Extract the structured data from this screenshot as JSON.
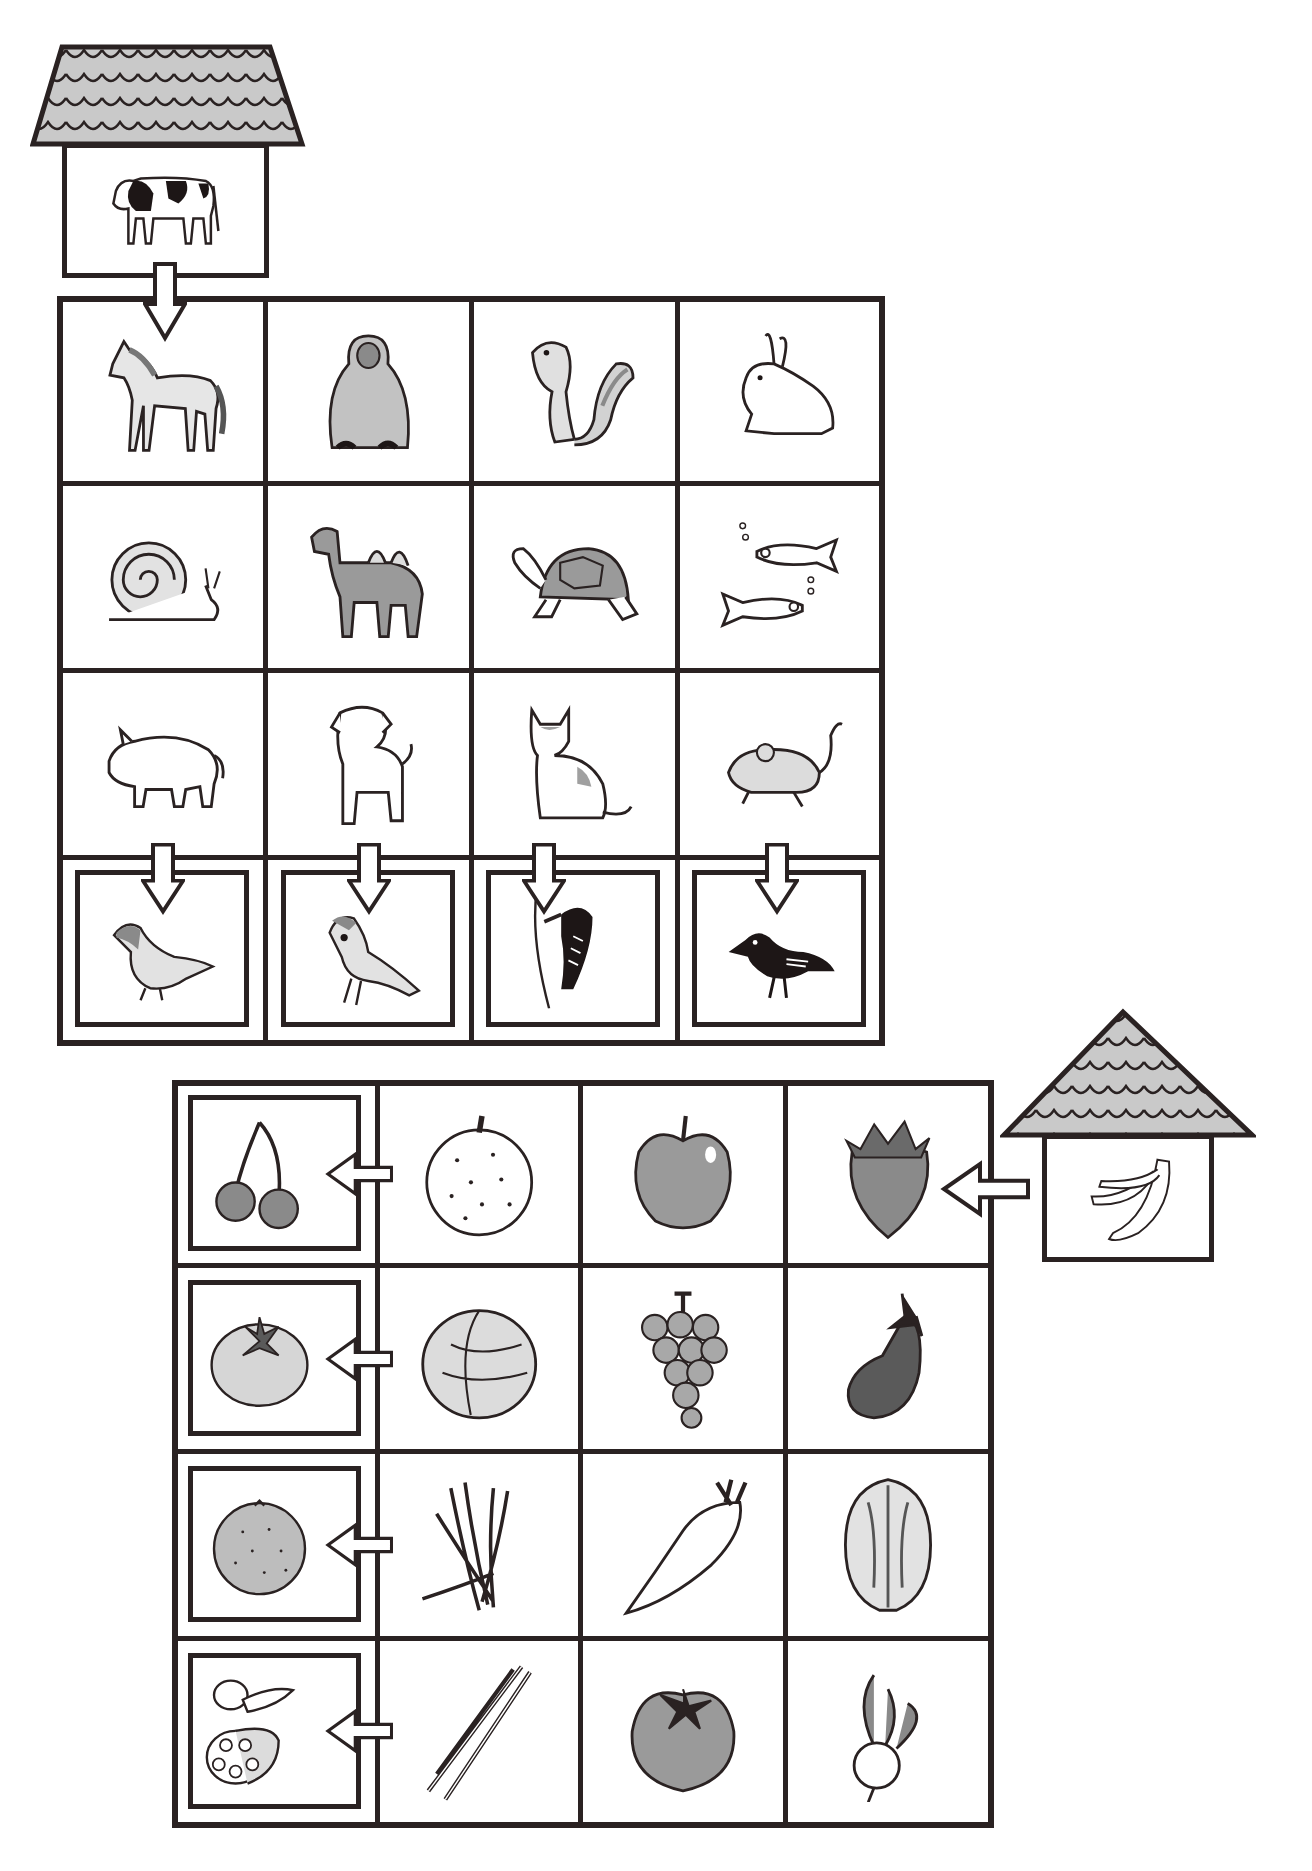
{
  "colors": {
    "ink": "#2a2222",
    "roof_fill": "#c9c9c9",
    "paper": "#ffffff",
    "mid_gray": "#9a9a9a",
    "dark_gray": "#5a5a5a",
    "light_gray": "#dcdcdc"
  },
  "animal_section": {
    "start_house": {
      "roof_style": "trapezoid-tiled",
      "occupant": "cow",
      "arrow_direction": "down",
      "arrow_target": "horse"
    },
    "grid": {
      "rows": 4,
      "cols": 4,
      "cells": [
        [
          "horse",
          "monkey",
          "chipmunk",
          "rabbit"
        ],
        [
          "snail",
          "camel",
          "tortoise",
          "medaka-fish"
        ],
        [
          "pig",
          "puppy",
          "cat",
          "mouse"
        ],
        [
          "pigeon",
          "sparrow",
          "woodpecker",
          "crow"
        ]
      ],
      "framed_row": 3,
      "framed_row_arrows": "down"
    }
  },
  "produce_section": {
    "start_house": {
      "roof_style": "triangle-tiled",
      "occupant": "bananas",
      "arrow_direction": "left",
      "arrow_target": "strawberry"
    },
    "grid": {
      "rows": 4,
      "cols": 4,
      "cells": [
        [
          "cherries",
          "japanese-pear",
          "apple",
          "strawberry"
        ],
        [
          "persimmon",
          "lettuce",
          "grapes",
          "eggplant"
        ],
        [
          "mandarin-orange",
          "bean-sprouts",
          "daikon-radish",
          "chinese-cabbage"
        ],
        [
          "shallot-and-lotus-root",
          "green-onion",
          "tomato",
          "turnip"
        ]
      ],
      "framed_col": 0,
      "framed_col_arrows": "left"
    }
  }
}
